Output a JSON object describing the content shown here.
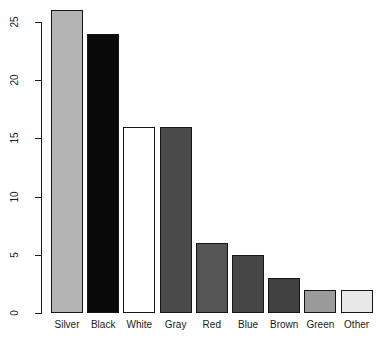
{
  "chart_data": {
    "type": "bar",
    "title": "",
    "subtitle": "",
    "xlabel": "",
    "ylabel": "",
    "categories": [
      "Silver",
      "Black",
      "White",
      "Gray",
      "Red",
      "Blue",
      "Brown",
      "Green",
      "Other"
    ],
    "values": [
      26,
      24,
      16,
      16,
      6,
      5,
      3,
      2,
      2
    ],
    "bar_colors": [
      "#b4b4b4",
      "#0a0a0a",
      "#ffffff",
      "#4a4a4a",
      "#555555",
      "#464646",
      "#414141",
      "#9a9a9a",
      "#e8e8e8"
    ],
    "bar_border_color": "#151515",
    "ylim": [
      0,
      26
    ],
    "yticks": [
      0,
      5,
      10,
      15,
      20,
      25
    ],
    "ytick_labels": [
      "0",
      "5",
      "10",
      "15",
      "20",
      "25"
    ],
    "grid": false,
    "legend": false,
    "legend_position": "none",
    "axis_color": "#1a1a1a",
    "background_color": "#ffffff"
  }
}
